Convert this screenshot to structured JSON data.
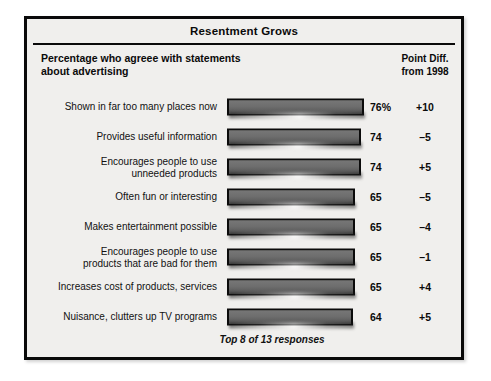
{
  "title": "Resentment Grows",
  "header": {
    "left_line1": "Percentage who agreee with statements",
    "left_line2": "about advertising",
    "right_line1": "Point Diff.",
    "right_line2": "from 1998"
  },
  "footnote": "Top 8 of 13 responses",
  "colors": {
    "frame_border": "#0a0a0a",
    "panel_background": "#f0efed",
    "bar_fill": "#6b6b6b",
    "bar_border": "#0b0b0b",
    "text": "#0a0a0a"
  },
  "chart_data": {
    "type": "bar",
    "title": "Resentment Grows",
    "subtitle": "Percentage who agreee with statements about advertising",
    "xlabel": "",
    "ylabel": "",
    "xlim": [
      0,
      80
    ],
    "grid": false,
    "legend": "none",
    "orientation": "horizontal",
    "note": "Top 8 of 13 responses",
    "value_suffix_first_row": "%",
    "extra_column_header": "Point Diff. from 1998",
    "categories": [
      "Shown in far too many places now",
      "Provides useful information",
      "Encourages people to use unneeded products",
      "Often fun or interesting",
      "Makes entertainment possible",
      "Encourages people to use products that are bad for them",
      "Increases cost of products, services",
      "Nuisance, clutters up TV programs"
    ],
    "values": [
      76,
      74,
      74,
      65,
      65,
      65,
      65,
      64
    ],
    "value_labels": [
      "76%",
      "74",
      "74",
      "65",
      "65",
      "65",
      "65",
      "64"
    ],
    "point_diff": [
      10,
      -5,
      5,
      -5,
      -4,
      -1,
      4,
      5
    ],
    "point_diff_labels": [
      "+10",
      "–5",
      "+5",
      "–5",
      "–4",
      "–1",
      "+4",
      "+5"
    ]
  },
  "rows": [
    {
      "label_line1": "Shown in far too many places now",
      "label_line2": "",
      "value": "76%",
      "diff": "+10",
      "bar_width": 137
    },
    {
      "label_line1": "Provides useful information",
      "label_line2": "",
      "value": "74",
      "diff": "–5",
      "bar_width": 134
    },
    {
      "label_line1": "Encourages people to use",
      "label_line2": "unneeded products",
      "value": "74",
      "diff": "+5",
      "bar_width": 134
    },
    {
      "label_line1": "Often fun or interesting",
      "label_line2": "",
      "value": "65",
      "diff": "–5",
      "bar_width": 128
    },
    {
      "label_line1": "Makes entertainment possible",
      "label_line2": "",
      "value": "65",
      "diff": "–4",
      "bar_width": 128
    },
    {
      "label_line1": "Encourages people to use",
      "label_line2": "products that are bad for them",
      "value": "65",
      "diff": "–1",
      "bar_width": 128
    },
    {
      "label_line1": "Increases cost of products, services",
      "label_line2": "",
      "value": "65",
      "diff": "+4",
      "bar_width": 128
    },
    {
      "label_line1": "Nuisance, clutters up TV programs",
      "label_line2": "",
      "value": "64",
      "diff": "+5",
      "bar_width": 126
    }
  ]
}
